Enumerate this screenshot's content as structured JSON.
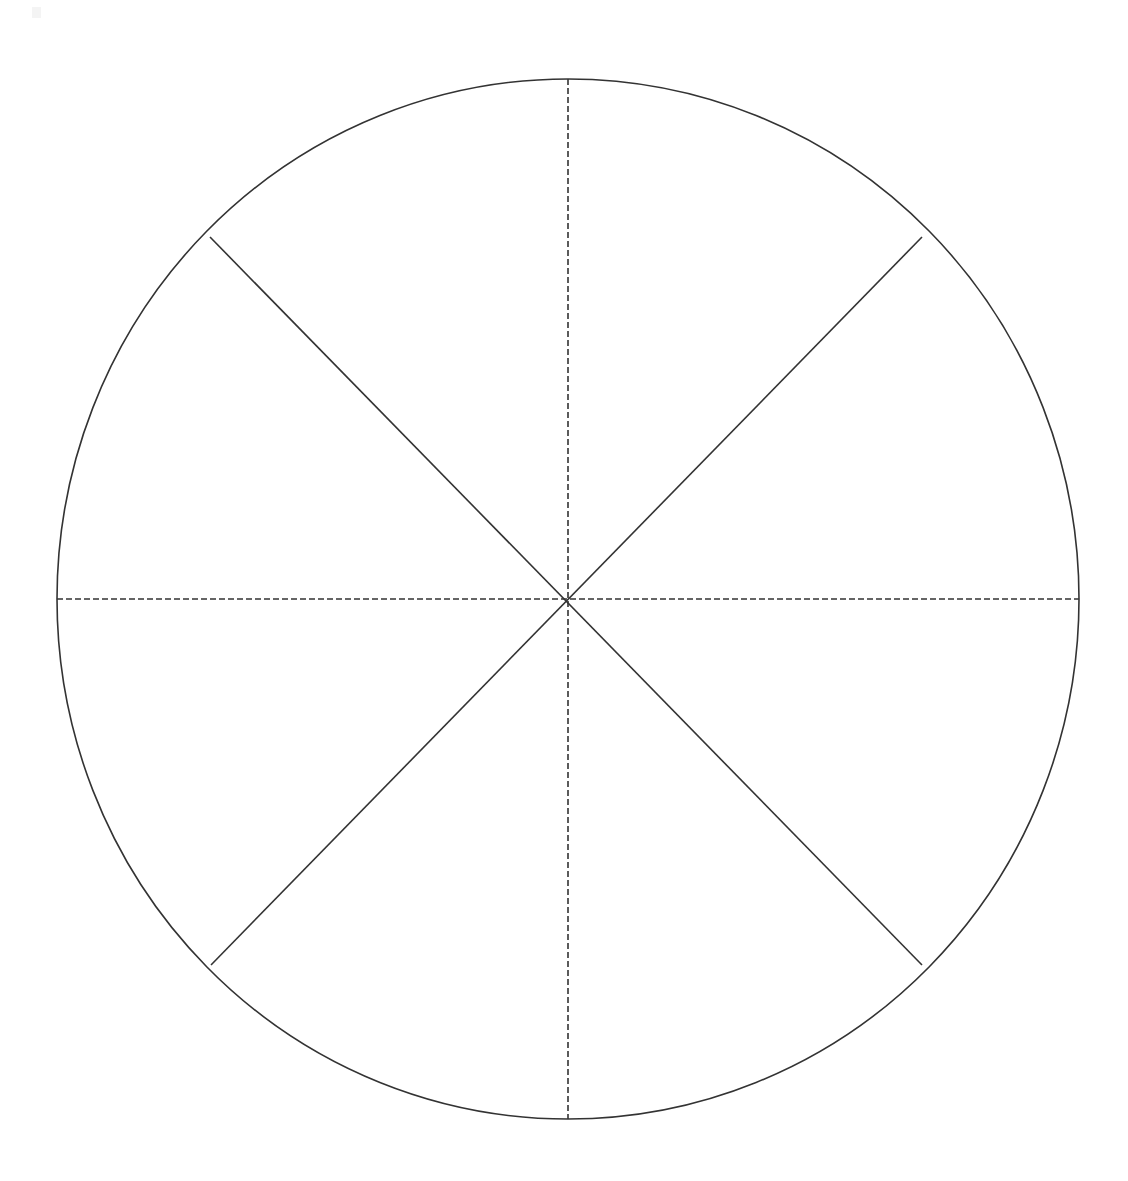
{
  "document": {
    "title": "Circle Divided Into Eight Sectors",
    "background_color": "#ffffff",
    "width": 1128,
    "height": 1181,
    "visible_text": ""
  },
  "figure": {
    "name": "eight-sector-circle",
    "stroke_color": "#333333",
    "fill_color": "none",
    "stroke_width": 1.6
  },
  "chart_data": {
    "type": "pie",
    "title": "",
    "subtitle": "",
    "xlabel": "",
    "ylabel": "",
    "legend": [],
    "annotations": [],
    "grid": false,
    "categories": [
      "sector-1",
      "sector-2",
      "sector-3",
      "sector-4",
      "sector-5",
      "sector-6",
      "sector-7",
      "sector-8"
    ],
    "values": [
      45,
      45,
      45,
      45,
      45,
      45,
      45,
      45
    ],
    "units": "degrees",
    "total": 360,
    "center": {
      "x": 568,
      "y": 599
    },
    "radius_x": 511,
    "radius_y": 520,
    "divider_count": 4,
    "dividers": [
      {
        "name": "vertical-diameter",
        "style": "dashed",
        "angle_deg": 90,
        "x1": 568,
        "y1": 79,
        "x2": 568,
        "y2": 1119,
        "full_diameter": true
      },
      {
        "name": "horizontal-diameter",
        "style": "dashed",
        "angle_deg": 0,
        "x1": 57,
        "y1": 599,
        "x2": 1079,
        "y2": 599,
        "full_diameter": true
      },
      {
        "name": "diagonal-nw-se",
        "style": "solid",
        "angle_deg": 135,
        "x1": 210,
        "y1": 237,
        "x2": 922,
        "y2": 965,
        "full_diameter": true
      },
      {
        "name": "diagonal-ne-sw",
        "style": "solid",
        "angle_deg": 45,
        "x1": 922,
        "y1": 237,
        "x2": 211,
        "y2": 965,
        "full_diameter": true
      }
    ],
    "dash_pattern": "6 3"
  },
  "artifact": {
    "name": "scan-speck",
    "x": 36,
    "y": 11,
    "color": "#f4f4f4"
  }
}
